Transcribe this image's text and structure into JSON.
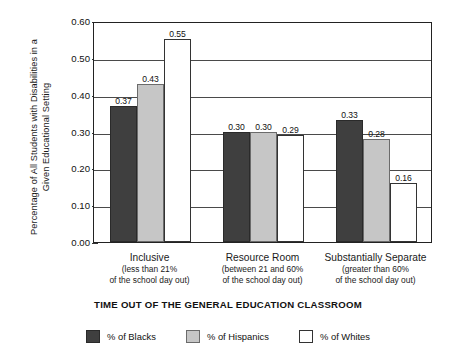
{
  "chart_data": {
    "type": "bar",
    "title": "",
    "xlabel": "TIME OUT OF THE GENERAL EDUCATION CLASSROOM",
    "ylabel": "Percentage of All Students with Disabilities in a Given Educational Setting",
    "ylabel_line1": "Percentage of All Students with Disabilities in a",
    "ylabel_line2": "Given Educational Setting",
    "ylim": [
      0.0,
      0.6
    ],
    "ytick_labels": [
      "0.60",
      "0.50",
      "0.40",
      "0.30",
      "0.20",
      "0.10",
      "0.00"
    ],
    "ytick_values": [
      0.6,
      0.5,
      0.4,
      0.3,
      0.2,
      0.1,
      0.0
    ],
    "grid": "horizontal",
    "legend_position": "bottom",
    "categories": [
      {
        "name": "Inclusive",
        "sub_line1": "(less than 21%",
        "sub_line2": "of the school day out)"
      },
      {
        "name": "Resource Room",
        "sub_line1": "(between 21 and 60%",
        "sub_line2": "of the school day out)"
      },
      {
        "name": "Substantially Separate",
        "sub_line1": "(greater than 60%",
        "sub_line2": "of the school day out)"
      }
    ],
    "series": [
      {
        "name": "% of Blacks",
        "color": "#3f3f3f",
        "values": [
          0.37,
          0.3,
          0.33
        ],
        "labels": [
          "0.37",
          "0.30",
          "0.33"
        ]
      },
      {
        "name": "% of Hispanics",
        "color": "#c6c6c6",
        "values": [
          0.43,
          0.3,
          0.28
        ],
        "labels": [
          "0.43",
          "0.30",
          "0.28"
        ]
      },
      {
        "name": "% of Whites",
        "color": "#ffffff",
        "values": [
          0.55,
          0.29,
          0.16
        ],
        "labels": [
          "0.55",
          "0.29",
          "0.16"
        ]
      }
    ]
  }
}
